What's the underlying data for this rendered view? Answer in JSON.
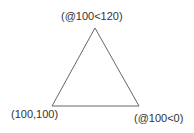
{
  "diagram": {
    "shape": "triangle",
    "stroke_color": "#666666",
    "vertices": [
      {
        "id": "apex",
        "label": "(@100<120)"
      },
      {
        "id": "bottom-left",
        "label": "(100,100)"
      },
      {
        "id": "bottom-right",
        "label": "(@100<0)"
      }
    ]
  }
}
